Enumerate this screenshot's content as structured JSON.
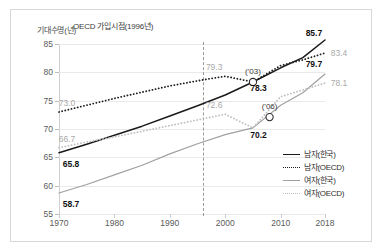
{
  "chart_data": {
    "type": "line",
    "title": "",
    "xlabel": "",
    "ylabel": "기대수명(년)",
    "ylim": [
      55,
      85
    ],
    "xlim": [
      1970,
      2018
    ],
    "grid": true,
    "legend_position": "right-inside",
    "yticks": [
      "85",
      "80",
      "75",
      "70",
      "65",
      "60",
      "55"
    ],
    "xticks": [
      "1970",
      "1980",
      "1990",
      "2000",
      "2010",
      "2018"
    ],
    "annotation": "OECD 가입시점(1996년)",
    "annotation_year": 1996,
    "series": [
      {
        "name": "남자(한국)",
        "style": "solid",
        "color": "#1a1a1a",
        "x": [
          1970,
          1975,
          1980,
          1985,
          1990,
          1995,
          2000,
          2005,
          2010,
          2014,
          2018
        ],
        "values": [
          65.8,
          67.3,
          68.9,
          70.5,
          72.3,
          74.1,
          76.0,
          78.3,
          80.8,
          82.6,
          85.7
        ]
      },
      {
        "name": "남자(OECD)",
        "style": "dotted",
        "color": "#1a1a1a",
        "x": [
          1970,
          1975,
          1980,
          1985,
          1990,
          1995,
          2000,
          2005,
          2010,
          2014,
          2018
        ],
        "values": [
          73.0,
          74.2,
          75.4,
          76.5,
          77.6,
          78.5,
          79.3,
          78.3,
          81.2,
          82.2,
          83.4
        ]
      },
      {
        "name": "여자(한국)",
        "style": "solid",
        "color": "#a0a0a0",
        "x": [
          1970,
          1975,
          1980,
          1985,
          1990,
          1995,
          2000,
          2005,
          2010,
          2014,
          2018
        ],
        "values": [
          58.7,
          60.2,
          61.9,
          63.6,
          65.6,
          67.4,
          69.0,
          70.2,
          74.2,
          76.4,
          79.7
        ]
      },
      {
        "name": "여자(OECD)",
        "style": "dotted",
        "color": "#bfbfbf",
        "x": [
          1970,
          1975,
          1980,
          1985,
          1990,
          1995,
          2000,
          2005,
          2010,
          2014,
          2018
        ],
        "values": [
          66.7,
          67.7,
          68.6,
          69.6,
          70.6,
          71.6,
          72.6,
          70.2,
          75.7,
          76.9,
          78.1
        ]
      }
    ],
    "point_labels": [
      {
        "name": "male-oecd-1970",
        "text": "73.0",
        "year": 1970,
        "value": 73.0,
        "tone": "gray",
        "dx": 8,
        "dy": -9
      },
      {
        "name": "female-oecd-1970",
        "text": "66.7",
        "year": 1970,
        "value": 66.7,
        "tone": "gray",
        "dx": 8,
        "dy": -9
      },
      {
        "name": "male-korea-1970",
        "text": "65.8",
        "year": 1970,
        "value": 65.8,
        "tone": "bold",
        "dx": 12,
        "dy": 11
      },
      {
        "name": "female-korea-1970",
        "text": "58.7",
        "year": 1970,
        "value": 58.7,
        "tone": "bold",
        "dx": 12,
        "dy": 11
      },
      {
        "name": "male-oecd-2000",
        "text": "79.3",
        "year": 1998,
        "value": 79.3,
        "tone": "gray",
        "dx": 0,
        "dy": -9
      },
      {
        "name": "female-oecd-2000",
        "text": "72.6",
        "year": 1998,
        "value": 72.6,
        "tone": "gray",
        "dx": 0,
        "dy": -9
      },
      {
        "name": "male-cross-2003",
        "text": "78.3",
        "year": 2006,
        "value": 77.2,
        "tone": "bold",
        "dx": 0,
        "dy": 0
      },
      {
        "name": "female-cross-2006",
        "text": "70.2",
        "year": 2006,
        "value": 69.0,
        "tone": "bold",
        "dx": 0,
        "dy": 0
      },
      {
        "name": "male-korea-2018",
        "text": "85.7",
        "year": 2016,
        "value": 85.4,
        "tone": "bold",
        "dx": 0,
        "dy": -9
      },
      {
        "name": "male-oecd-2018",
        "text": "83.4",
        "year": 2018,
        "value": 83.4,
        "tone": "gray",
        "dx": 14,
        "dy": 0
      },
      {
        "name": "female-korea-2018",
        "text": "79.7",
        "year": 2016,
        "value": 79.9,
        "tone": "bold",
        "dx": 0,
        "dy": -9
      },
      {
        "name": "female-oecd-2018",
        "text": "78.1",
        "year": 2018,
        "value": 78.1,
        "tone": "gray",
        "dx": 14,
        "dy": 0
      }
    ],
    "crossing_markers": [
      {
        "name": "male-crossing-marker",
        "label": "('03)",
        "year": 2005,
        "value": 78.3
      },
      {
        "name": "female-crossing-marker",
        "label": "('06)",
        "year": 2008,
        "value": 72.1
      }
    ]
  }
}
